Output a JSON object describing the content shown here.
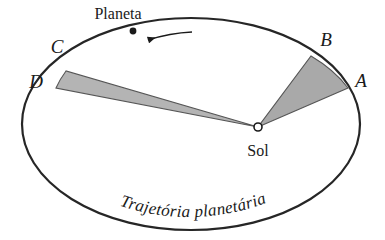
{
  "diagram": {
    "title_caption": "Trajetória planetária",
    "background_color": "#ffffff",
    "orbit": {
      "name": "planetary-orbit-ellipse",
      "stroke_color": "#262626",
      "fill_color": "#ffffff",
      "center_x": 191,
      "center_y": 124,
      "radius_x": 169,
      "radius_y": 106,
      "stroke_width": 2.2
    },
    "sun": {
      "label": "Sol",
      "marker_name": "sun-marker",
      "x": 258,
      "y": 127,
      "radius": 4,
      "fill_color": "#ffffff",
      "stroke_color": "#1a1a1a",
      "label_x": 258,
      "label_y": 151
    },
    "planet": {
      "label": "Planeta",
      "dot_x": 133,
      "dot_y": 31,
      "dot_radius": 3.4,
      "dot_color": "#1a1a1a",
      "label_x": 118,
      "label_y": 14
    },
    "direction_arrow": {
      "name": "orbit-direction-arrow",
      "from_x": 192,
      "from_y": 32,
      "to_x": 146,
      "to_y": 40,
      "color": "#1a1a1a",
      "description": "counter-clockwise motion indicator"
    },
    "sectors": [
      {
        "name": "sector-sun-A-B",
        "label": "Setor SAB",
        "fill_color": "#a9a9a9",
        "stroke_color": "#555555",
        "vertices": [
          {
            "point": "Sol",
            "x": 258,
            "y": 127
          },
          {
            "point": "A",
            "x": 348,
            "y": 88
          },
          {
            "point": "B",
            "x": 311,
            "y": 56
          }
        ]
      },
      {
        "name": "sector-sun-C-D",
        "label": "Setor SCD",
        "fill_color": "#b4b4b4",
        "stroke_color": "#555555",
        "vertices": [
          {
            "point": "Sol",
            "x": 258,
            "y": 127
          },
          {
            "point": "C",
            "x": 66,
            "y": 71
          },
          {
            "point": "D",
            "x": 56,
            "y": 88
          }
        ]
      }
    ],
    "vertex_labels": [
      {
        "id": "label-A",
        "text": "A",
        "x": 361,
        "y": 86
      },
      {
        "id": "label-B",
        "text": "B",
        "x": 325,
        "y": 45
      },
      {
        "id": "label-C",
        "text": "C",
        "x": 57,
        "y": 52
      },
      {
        "id": "label-D",
        "text": "D",
        "x": 36,
        "y": 86
      }
    ],
    "caption": {
      "name": "orbit-caption",
      "text": "Trajetória planetária",
      "path_start_x": 73,
      "path_start_y": 190,
      "path_end_x": 310,
      "path_end_y": 190
    }
  }
}
